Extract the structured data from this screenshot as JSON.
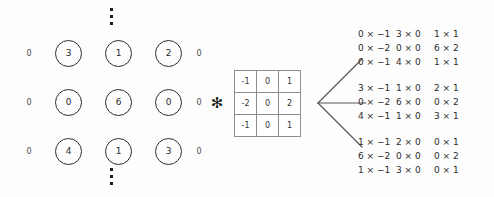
{
  "figure": {
    "operator": "✻",
    "background_color": "#fdfdfe",
    "ink_color": "#2b2b2b"
  },
  "image_grid": {
    "pad_label": "0",
    "top_ellipsis": "vertical-ellipsis",
    "bottom_ellipsis": "vertical-ellipsis",
    "rows": [
      {
        "left_pad": "0",
        "values": [
          "3",
          "1",
          "2"
        ],
        "right_pad": "0"
      },
      {
        "left_pad": "0",
        "values": [
          "0",
          "6",
          "0"
        ],
        "right_pad": "0"
      },
      {
        "left_pad": "0",
        "values": [
          "4",
          "1",
          "3"
        ],
        "right_pad": "0"
      }
    ]
  },
  "kernel": {
    "name": "sobel-x",
    "rows": [
      [
        "-1",
        "0",
        "1"
      ],
      [
        "-2",
        "0",
        "2"
      ],
      [
        "-1",
        "0",
        "1"
      ]
    ]
  },
  "connector": {
    "name": "three-way-fan",
    "branches": [
      "up",
      "middle",
      "down"
    ],
    "color": "#555555"
  },
  "products": [
    {
      "name": "top-window-products",
      "rows": [
        [
          "0 × −1",
          "3 × 0",
          "1 × 1"
        ],
        [
          "0 × −2",
          "0 × 0",
          "6 × 2"
        ],
        [
          "0 × −1",
          "4 × 0",
          "1 × 1"
        ]
      ]
    },
    {
      "name": "middle-window-products",
      "rows": [
        [
          "3 × −1",
          "1 × 0",
          "2 × 1"
        ],
        [
          "0 × −2",
          "6 × 0",
          "0 × 2"
        ],
        [
          "4 × −1",
          "1 × 0",
          "3 × 1"
        ]
      ]
    },
    {
      "name": "bottom-window-products",
      "rows": [
        [
          "1 × −1",
          "2 × 0",
          "0 × 1"
        ],
        [
          "6 × −2",
          "0 × 0",
          "0 × 2"
        ],
        [
          "1 × −1",
          "3 × 0",
          "0 × 1"
        ]
      ]
    }
  ]
}
